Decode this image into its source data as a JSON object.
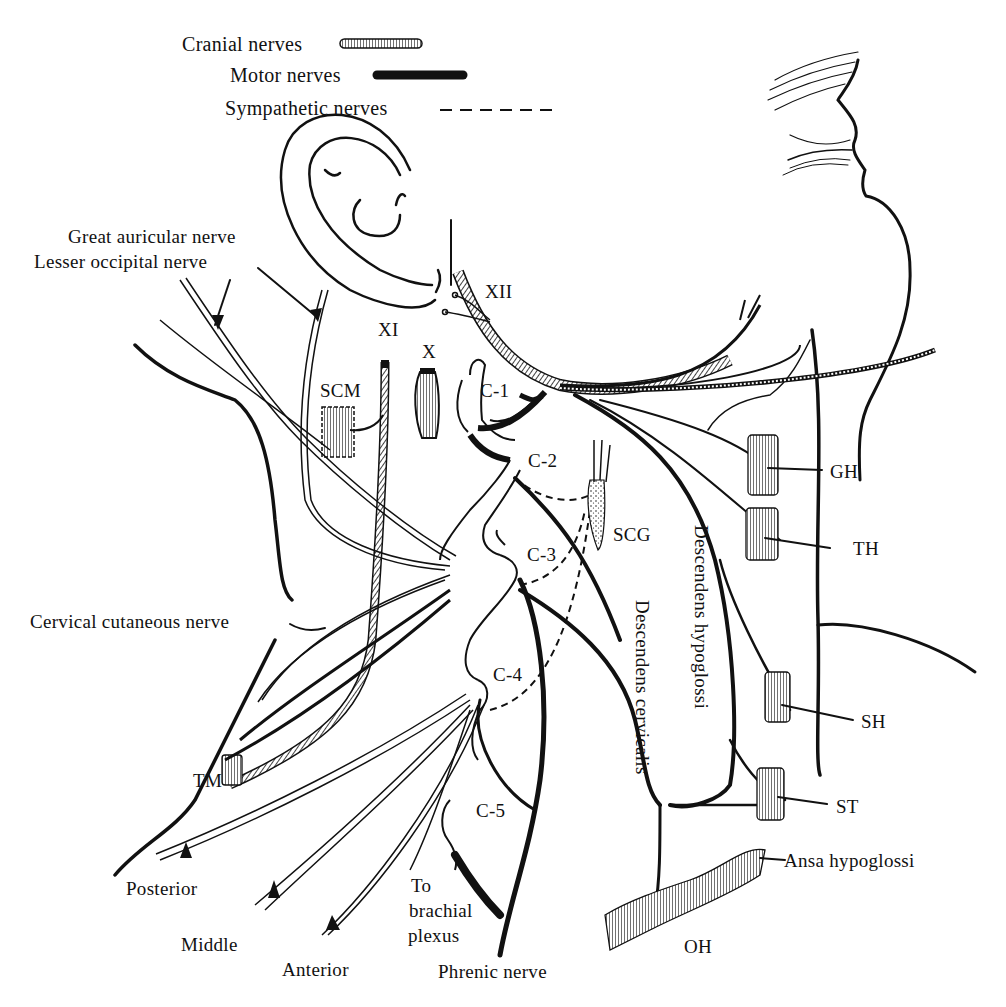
{
  "figure": {
    "title_fragment": "(cut off)"
  },
  "legend": {
    "items": [
      {
        "label": "Cranial nerves",
        "style": "hatched-cord"
      },
      {
        "label": "Motor nerves",
        "style": "solid-thick"
      },
      {
        "label": "Sympathetic nerves",
        "style": "dashed"
      }
    ]
  },
  "labels": {
    "great_auricular": "Great auricular nerve",
    "lesser_occipital": "Lesser occipital nerve",
    "xii": "XII",
    "xi": "XI",
    "x": "X",
    "scm": "SCM",
    "c1": "C-1",
    "c2": "C-2",
    "c3": "C-3",
    "c4": "C-4",
    "c5": "C-5",
    "scg": "SCG",
    "gh": "GH",
    "th": "TH",
    "sh": "SH",
    "st": "ST",
    "oh": "OH",
    "tm": "TM",
    "cervical_cutaneous": "Cervical cutaneous nerve",
    "descendens_hypoglossi": "Descendens hypoglossi",
    "descendens_cervicalis": "Descendens cervicalis",
    "ansa_hypoglossi": "Ansa hypoglossi",
    "posterior": "Posterior",
    "middle": "Middle",
    "anterior": "Anterior",
    "to_brachial_1": "To",
    "to_brachial_2": "brachial",
    "to_brachial_3": "plexus",
    "phrenic": "Phrenic nerve"
  },
  "colors": {
    "ink": "#111111",
    "background": "#ffffff"
  }
}
